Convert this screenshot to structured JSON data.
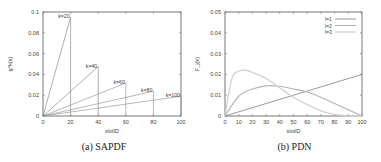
{
  "chart_data": [
    {
      "type": "line",
      "title": "",
      "caption": "(a) SAPDF",
      "xlabel": "slotID",
      "ylabel": "g^k(x)",
      "xlim": [
        0,
        100
      ],
      "ylim": [
        0,
        0.1
      ],
      "xticks": [
        "0",
        "20",
        "40",
        "60",
        "80",
        "100"
      ],
      "yticks": [
        "0",
        "0.02",
        "0.04",
        "0.06",
        "0.08",
        "0.1"
      ],
      "grid": false,
      "series": [
        {
          "name": "k=20",
          "x": [
            0,
            20,
            20
          ],
          "y": [
            0,
            0.095,
            0
          ]
        },
        {
          "name": "k=40",
          "x": [
            0,
            40,
            40
          ],
          "y": [
            0,
            0.0475,
            0
          ]
        },
        {
          "name": "k=60",
          "x": [
            0,
            60,
            60
          ],
          "y": [
            0,
            0.0317,
            0
          ]
        },
        {
          "name": "k=80",
          "x": [
            0,
            80,
            80
          ],
          "y": [
            0,
            0.0238,
            0
          ]
        },
        {
          "name": "k=100",
          "x": [
            0,
            100,
            100
          ],
          "y": [
            0,
            0.019,
            0
          ]
        }
      ]
    },
    {
      "type": "line",
      "title": "",
      "caption": "(b) PDN",
      "xlabel": "slotID",
      "ylabel": "F_j(k)",
      "xlim": [
        0,
        100
      ],
      "ylim": [
        0,
        0.05
      ],
      "xticks": [
        "0",
        "10",
        "20",
        "30",
        "40",
        "50",
        "60",
        "70",
        "80",
        "90",
        "100"
      ],
      "yticks": [
        "0",
        "0.01",
        "0.02",
        "0.03",
        "0.04",
        "0.05"
      ],
      "grid": false,
      "legend_position": "top-right",
      "legend": [
        "l=1",
        "l=2",
        "l=3"
      ],
      "series": [
        {
          "name": "l=1",
          "x": [
            0,
            100
          ],
          "y": [
            0,
            0.02
          ]
        },
        {
          "name": "l=2",
          "x": [
            0,
            10,
            20,
            30,
            40,
            50,
            60,
            70,
            80,
            90,
            100
          ],
          "y": [
            0,
            0.0095,
            0.013,
            0.0145,
            0.0143,
            0.013,
            0.0115,
            0.009,
            0.006,
            0.003,
            0
          ]
        },
        {
          "name": "l=3",
          "x": [
            0,
            5,
            10,
            15,
            20,
            30,
            40,
            50,
            60,
            70,
            80,
            90,
            100
          ],
          "y": [
            0,
            0.018,
            0.0215,
            0.022,
            0.021,
            0.018,
            0.0135,
            0.009,
            0.0055,
            0.0025,
            0.0008,
            0.0001,
            0
          ]
        }
      ]
    }
  ]
}
